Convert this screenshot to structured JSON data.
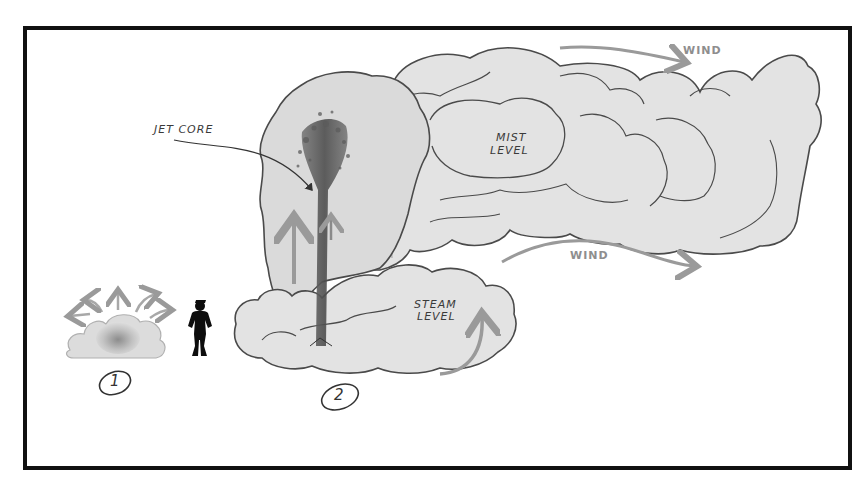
{
  "diagram": {
    "frame": {
      "border_color": "#111111",
      "background": "#ffffff"
    },
    "colors": {
      "cloud_fill": "#e3e3e3",
      "cloud_fill_dark": "#d6d6d6",
      "cloud_outline": "#4a4a4a",
      "jet_core": "#5a5a5a",
      "arrow_gray": "#9a9a9a",
      "silhouette": "#0d0d0d"
    },
    "labels": {
      "jet_core": "JET CORE",
      "mist_level_line1": "MIST",
      "mist_level_line2": "LEVEL",
      "steam_level_line1": "STEAM",
      "steam_level_line2": "LEVEL",
      "wind_top": "WIND",
      "wind_middle": "WIND"
    },
    "stages": [
      {
        "number": "1",
        "description": "small burst with radiating arrows"
      },
      {
        "number": "2",
        "description": "full eruption with jet core, steam and mist clouds"
      }
    ],
    "scale_figure": "human-silhouette"
  }
}
